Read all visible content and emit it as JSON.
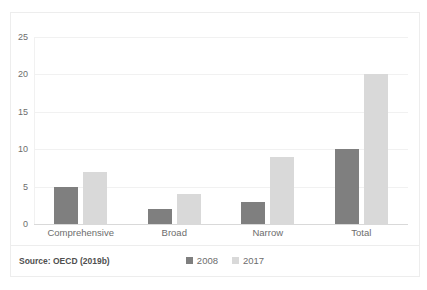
{
  "chart_data": {
    "type": "bar",
    "title": "",
    "subtitle": "",
    "xlabel": "",
    "ylabel": "",
    "categories": [
      "Comprehensive",
      "Broad",
      "Narrow",
      "Total"
    ],
    "series": [
      {
        "name": "2008",
        "values": [
          5,
          2,
          3,
          10
        ],
        "color": "#7f7f7f"
      },
      {
        "name": "2017",
        "values": [
          7,
          4,
          9,
          20
        ],
        "color": "#d9d9d9"
      }
    ],
    "ylim": [
      0,
      25
    ],
    "yticks": [
      0,
      5,
      10,
      15,
      20,
      25
    ],
    "ytick_labels": [
      "0",
      "5",
      "10",
      "15",
      "20",
      "25"
    ],
    "grid": true,
    "grid_axis": "y",
    "legend_position": "bottom-center",
    "annotations": []
  },
  "footer": {
    "source_note": "Source: OECD (2019b)"
  },
  "colors": {
    "series_2008": "#7f7f7f",
    "series_2017": "#d9d9d9",
    "gridline": "#f1f1f1",
    "border": "#ededed",
    "text": "#6d6d6d"
  }
}
